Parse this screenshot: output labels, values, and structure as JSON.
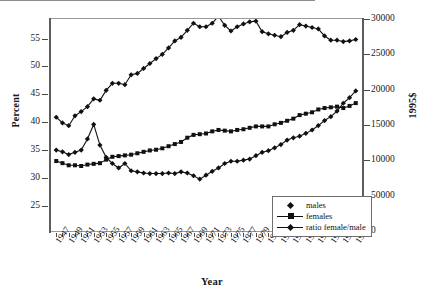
{
  "chart_data": {
    "type": "line",
    "title": "",
    "xlabel": "Year",
    "ylabel": "Percent",
    "ylabel_right": "1995$",
    "grid": false,
    "legend_position": "inside-bottom-right",
    "xlim": [
      1946,
      1996
    ],
    "ylim": [
      20.5,
      58.5
    ],
    "ylim_right": [
      0,
      30000
    ],
    "x_tick_step": 1,
    "x_label_step": 2,
    "x_tick_labels": [
      "1947",
      "1949",
      "1951",
      "1953",
      "1955",
      "1957",
      "1959",
      "1961",
      "1963",
      "1965",
      "1967",
      "1969",
      "1971",
      "1973",
      "1975",
      "1977",
      "1979",
      "1981",
      "1983",
      "1985",
      "1987",
      "1989",
      "1991",
      "1993",
      "1995"
    ],
    "y_tick_labels": [
      "25",
      "30",
      "35",
      "40",
      "45",
      "50",
      "55"
    ],
    "y_tick_values": [
      25,
      30,
      35,
      40,
      45,
      50,
      55
    ],
    "y_right_tick_labels": [
      "0",
      "50000",
      "10000",
      "15000",
      "20000",
      "25000",
      "30000"
    ],
    "y_right_tick_values": [
      0,
      5000,
      10000,
      15000,
      20000,
      25000,
      30000
    ],
    "x": [
      1947,
      1948,
      1949,
      1950,
      1951,
      1952,
      1953,
      1954,
      1955,
      1956,
      1957,
      1958,
      1959,
      1960,
      1961,
      1962,
      1963,
      1964,
      1965,
      1966,
      1967,
      1968,
      1969,
      1970,
      1971,
      1972,
      1973,
      1974,
      1975,
      1976,
      1977,
      1978,
      1979,
      1980,
      1981,
      1982,
      1983,
      1984,
      1985,
      1986,
      1987,
      1988,
      1989,
      1990,
      1991,
      1992,
      1993,
      1994,
      1995
    ],
    "series": [
      {
        "name": "males",
        "axis": "right",
        "marker": "diamond",
        "values": [
          16100,
          15300,
          14900,
          16300,
          16900,
          17600,
          18700,
          18500,
          19900,
          20900,
          20900,
          20700,
          22100,
          22300,
          23000,
          23700,
          24400,
          25000,
          25900,
          26900,
          27400,
          28400,
          29400,
          28900,
          28900,
          29400,
          30400,
          29100,
          28300,
          28900,
          29300,
          29600,
          29700,
          28200,
          27900,
          27700,
          27500,
          28100,
          28400,
          29200,
          29000,
          28800,
          28600,
          27600,
          27000,
          27000,
          26800,
          26900,
          27100
        ]
      },
      {
        "name": "females",
        "axis": "right",
        "marker": "square",
        "values": [
          9900,
          9600,
          9300,
          9300,
          9200,
          9400,
          9500,
          9600,
          10100,
          10500,
          10600,
          10700,
          10800,
          11000,
          11200,
          11400,
          11500,
          11700,
          12000,
          12300,
          12600,
          13200,
          13600,
          13700,
          13800,
          14100,
          14300,
          14200,
          14100,
          14300,
          14400,
          14600,
          14800,
          14800,
          14800,
          15100,
          15300,
          15600,
          15900,
          16400,
          16600,
          16800,
          17200,
          17400,
          17500,
          17600,
          17400,
          17700,
          18100
        ]
      },
      {
        "name": "ratio female/male",
        "axis": "left",
        "marker": "diamond",
        "values": [
          45.0,
          43.1,
          42.0,
          40.4,
          37.4,
          35.0,
          36.8,
          38.8,
          41.6,
          41.3,
          42.7,
          43.5,
          45.2,
          45.1,
          46.0,
          46.2,
          47.5,
          47.9,
          48.3,
          49.2,
          50.0,
          50.7,
          51.6,
          52.5,
          53.4,
          54.2,
          55.0,
          55.5,
          56.2,
          57.0,
          57.6,
          57.0,
          56.2,
          56.0,
          56.8,
          58.0,
          58.3,
          57.9,
          57.3,
          57.0,
          57.3,
          57.5,
          57.3,
          57.5,
          57.4,
          57.5,
          57.6,
          57.6,
          57.6
        ]
      }
    ],
    "ratio_left_axis_values": [
      35.0,
      34.7,
      34.2,
      34.6,
      35.0,
      37.0,
      39.6,
      35.9,
      33.7,
      32.6,
      31.8,
      32.6,
      31.3,
      31.1,
      30.9,
      30.8,
      30.8,
      30.8,
      30.9,
      30.8,
      31.1,
      30.9,
      30.4,
      29.8,
      30.5,
      31.2,
      31.8,
      32.6,
      33.0,
      33.0,
      33.2,
      33.4,
      34.0,
      34.6,
      34.9,
      35.4,
      36.0,
      36.8,
      37.2,
      37.5,
      38.0,
      38.6,
      39.4,
      40.3,
      41.0,
      42.0,
      43.4,
      44.4,
      45.6
    ],
    "legend": [
      {
        "label": "males",
        "marker": "diamond"
      },
      {
        "label": "females",
        "marker": "square"
      },
      {
        "label": "ratio female/male",
        "marker": "diamond"
      }
    ]
  }
}
